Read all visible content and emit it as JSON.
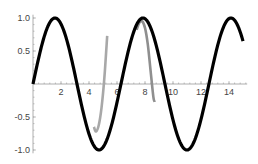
{
  "chart_data": {
    "type": "line",
    "title": "",
    "xlabel": "",
    "ylabel": "",
    "xlim": [
      0,
      15.3
    ],
    "ylim": [
      -1.05,
      1.05
    ],
    "grid": false,
    "legend": null,
    "x_ticks": [
      2,
      4,
      6,
      8,
      10,
      12,
      14
    ],
    "x_tick_labels": [
      "2",
      "4",
      "6",
      "8",
      "10",
      "12",
      "14"
    ],
    "y_ticks": [
      1.0,
      0.5,
      -0.5,
      -1.0
    ],
    "y_tick_labels": [
      "1.0",
      "0.5",
      "-0.5",
      "-1.0"
    ],
    "series": [
      {
        "name": "sin(x)",
        "color": "#000000",
        "width": 3.2,
        "function": "sin",
        "x_range": [
          0,
          15
        ],
        "points": [
          [
            0,
            0
          ],
          [
            1.57,
            1.0
          ],
          [
            3.14,
            0
          ],
          [
            4.71,
            -1.0
          ],
          [
            6.28,
            0
          ],
          [
            7.85,
            1.0
          ],
          [
            9.42,
            0
          ],
          [
            11.0,
            -1.0
          ],
          [
            12.57,
            0
          ],
          [
            14.14,
            1.0
          ],
          [
            15,
            0.65
          ]
        ]
      },
      {
        "name": "approximation 1",
        "color": "#a8a8a8",
        "width": 2.6,
        "points": [
          [
            4.35,
            -0.65
          ],
          [
            4.5,
            -0.72
          ],
          [
            4.7,
            -0.62
          ],
          [
            4.9,
            -0.35
          ],
          [
            5.1,
            0.1
          ],
          [
            5.3,
            0.73
          ]
        ]
      },
      {
        "name": "approximation 2",
        "color": "#8f8f8f",
        "width": 2.6,
        "points": [
          [
            7.4,
            0.82
          ],
          [
            7.6,
            0.93
          ],
          [
            7.8,
            0.95
          ],
          [
            8.0,
            0.85
          ],
          [
            8.2,
            0.6
          ],
          [
            8.4,
            0.2
          ],
          [
            8.6,
            -0.2
          ],
          [
            8.7,
            -0.27
          ]
        ]
      }
    ]
  }
}
